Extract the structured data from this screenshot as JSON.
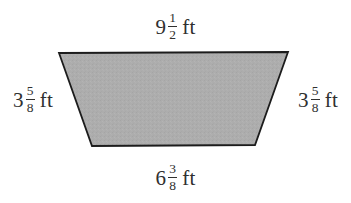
{
  "figure": {
    "shape_name": "trapezoid",
    "fill_color": "#adadad",
    "stroke_color": "#1c1c1c",
    "background_color": "#ffffff",
    "text_color": "#30302f",
    "vertices": {
      "top_left": [
        59,
        53
      ],
      "top_right": [
        288,
        52
      ],
      "bottom_right": [
        255,
        145
      ],
      "bottom_left": [
        92,
        146
      ]
    }
  },
  "labels": {
    "top": {
      "whole": "9",
      "numerator": "1",
      "denominator": "2",
      "unit": "ft",
      "full_text": "9 1/2 ft",
      "side": "top-base"
    },
    "bottom": {
      "whole": "6",
      "numerator": "3",
      "denominator": "8",
      "unit": "ft",
      "full_text": "6 3/8 ft",
      "side": "bottom-base"
    },
    "left": {
      "whole": "3",
      "numerator": "5",
      "denominator": "8",
      "unit": "ft",
      "full_text": "3 5/8 ft",
      "side": "left-leg"
    },
    "right": {
      "whole": "3",
      "numerator": "5",
      "denominator": "8",
      "unit": "ft",
      "full_text": "3 5/8 ft",
      "side": "right-leg"
    }
  }
}
